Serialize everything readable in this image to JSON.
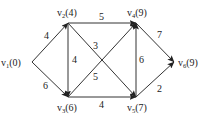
{
  "diagram": {
    "type": "directed-weighted-graph",
    "nodes": [
      {
        "id": "v1",
        "name": "v",
        "sub": "1",
        "value": "(0)",
        "x": 32,
        "y": 62
      },
      {
        "id": "v2",
        "name": "v",
        "sub": "2",
        "value": "(4)",
        "x": 68,
        "y": 23
      },
      {
        "id": "v3",
        "name": "v",
        "sub": "3",
        "value": "(6)",
        "x": 68,
        "y": 97
      },
      {
        "id": "v4",
        "name": "v",
        "sub": "4",
        "value": "(9)",
        "x": 136,
        "y": 23
      },
      {
        "id": "v5",
        "name": "v",
        "sub": "5",
        "value": "(7)",
        "x": 136,
        "y": 97
      },
      {
        "id": "v6",
        "name": "v",
        "sub": "6",
        "value": "(9)",
        "x": 174,
        "y": 62
      }
    ],
    "edges": [
      {
        "from": "v1",
        "to": "v2",
        "weight": "4"
      },
      {
        "from": "v1",
        "to": "v3",
        "weight": "6"
      },
      {
        "from": "v2",
        "to": "v3",
        "weight": "4"
      },
      {
        "from": "v2",
        "to": "v4",
        "weight": "5"
      },
      {
        "from": "v2",
        "to": "v5",
        "weight": "3"
      },
      {
        "from": "v3",
        "to": "v4",
        "weight": "5"
      },
      {
        "from": "v3",
        "to": "v5",
        "weight": "4"
      },
      {
        "from": "v5",
        "to": "v4",
        "weight": "6"
      },
      {
        "from": "v4",
        "to": "v6",
        "weight": "7"
      },
      {
        "from": "v5",
        "to": "v6",
        "weight": "2"
      }
    ]
  }
}
